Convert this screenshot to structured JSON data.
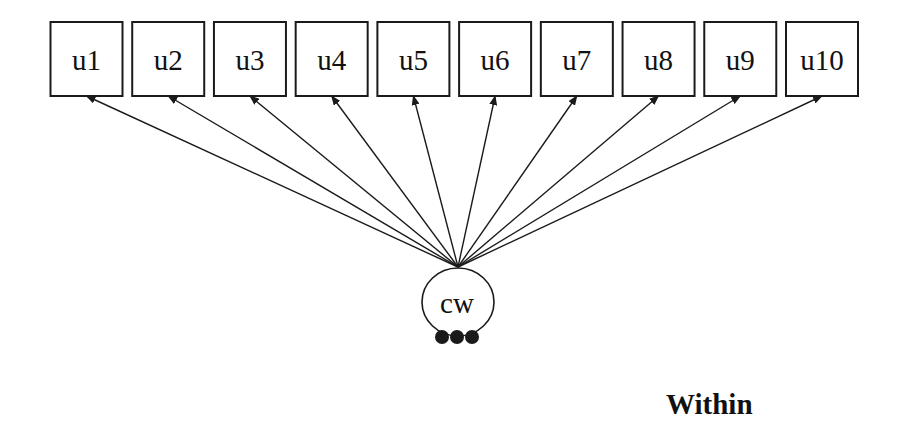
{
  "diagram": {
    "kind": "sem-path-diagram",
    "observed_nodes": [
      {
        "id": "u1",
        "label": "u1"
      },
      {
        "id": "u2",
        "label": "u2"
      },
      {
        "id": "u3",
        "label": "u3"
      },
      {
        "id": "u4",
        "label": "u4"
      },
      {
        "id": "u5",
        "label": "u5"
      },
      {
        "id": "u6",
        "label": "u6"
      },
      {
        "id": "u7",
        "label": "u7"
      },
      {
        "id": "u8",
        "label": "u8"
      },
      {
        "id": "u9",
        "label": "u9"
      },
      {
        "id": "u10",
        "label": "u10"
      }
    ],
    "latent_node": {
      "id": "cw",
      "label": "cw"
    },
    "edges": [
      {
        "from": "cw",
        "to": "u1"
      },
      {
        "from": "cw",
        "to": "u2"
      },
      {
        "from": "cw",
        "to": "u3"
      },
      {
        "from": "cw",
        "to": "u4"
      },
      {
        "from": "cw",
        "to": "u5"
      },
      {
        "from": "cw",
        "to": "u6"
      },
      {
        "from": "cw",
        "to": "u7"
      },
      {
        "from": "cw",
        "to": "u8"
      },
      {
        "from": "cw",
        "to": "u9"
      },
      {
        "from": "cw",
        "to": "u10"
      }
    ],
    "ellipsis_dot_count": 3,
    "section_label": "Within",
    "colors": {
      "stroke": "#1a1a1a",
      "node_fill": "#ffffff",
      "text": "#111111",
      "background": "#ffffff"
    }
  }
}
